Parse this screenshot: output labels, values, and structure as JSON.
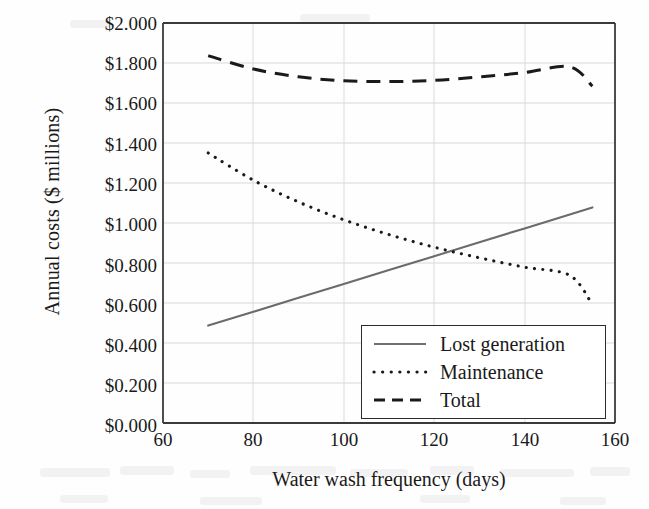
{
  "chart_data": {
    "type": "line",
    "title": "",
    "xlabel": "Water wash frequency (days)",
    "ylabel": "Annual costs ($ millions)",
    "xlim": [
      60,
      160
    ],
    "ylim": [
      0.0,
      2.0
    ],
    "xticks": [
      "60",
      "80",
      "100",
      "120",
      "140",
      "160"
    ],
    "yticks": [
      "$0.000",
      "$0.200",
      "$0.400",
      "$0.600",
      "$0.800",
      "$1.000",
      "$1.200",
      "$1.400",
      "$1.600",
      "$1.800",
      "$2.000"
    ],
    "grid": "horizontal-and-vertical",
    "legend_position": "lower-right-inside",
    "x": [
      70,
      80,
      90,
      100,
      110,
      120,
      130,
      140,
      150,
      155
    ],
    "series": [
      {
        "name": "Lost generation",
        "style": "solid",
        "color": "#6b6b6b",
        "values": [
          0.487,
          0.556,
          0.626,
          0.695,
          0.765,
          0.834,
          0.904,
          0.973,
          1.043,
          1.078
        ]
      },
      {
        "name": "Maintenance",
        "style": "dotted",
        "color": "#1a1a1a",
        "values": [
          1.35,
          1.214,
          1.105,
          1.016,
          0.942,
          0.879,
          0.826,
          0.779,
          0.738,
          0.592
        ]
      },
      {
        "name": "Total",
        "style": "dashed",
        "color": "#1a1a1a",
        "values": [
          1.837,
          1.77,
          1.731,
          1.711,
          1.707,
          1.713,
          1.73,
          1.752,
          1.781,
          1.684
        ]
      }
    ],
    "annotations": []
  },
  "legend": {
    "items": [
      {
        "label": "Lost generation",
        "swatch": "solid-line-swatch"
      },
      {
        "label": "Maintenance",
        "swatch": "dotted-line-swatch"
      },
      {
        "label": "Total",
        "swatch": "dashed-line-swatch"
      }
    ]
  }
}
